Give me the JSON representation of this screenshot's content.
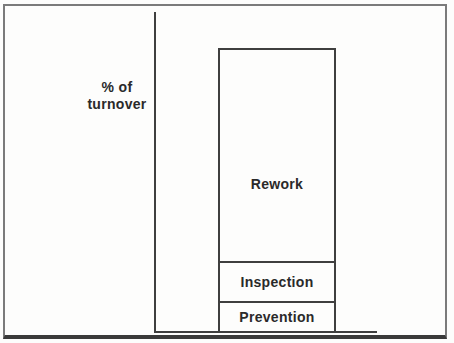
{
  "figure": {
    "y_axis_label_line1": "% of",
    "y_axis_label_line2": "turnover"
  },
  "chart_data": {
    "type": "bar",
    "stacked": true,
    "title": "",
    "xlabel": "",
    "ylabel": "% of turnover",
    "axes": {
      "ticks": false,
      "gridlines": false,
      "numeric_labels": false
    },
    "legend": "none (segments labelled inline)",
    "segments": [
      {
        "label": "Rework",
        "value": 80
      },
      {
        "label": "Inspection",
        "value": 13
      },
      {
        "label": "Prevention",
        "value": 7
      }
    ],
    "value_note": "values are relative segment heights estimated from the drawing, expressed as % of total bar height; no numeric scale is printed on the figure"
  }
}
